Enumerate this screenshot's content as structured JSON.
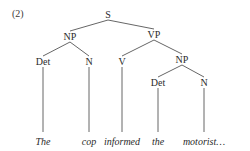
{
  "example_number": "(2)",
  "tree": {
    "nodes": [
      {
        "id": "S",
        "label": "S",
        "type": "phrase"
      },
      {
        "id": "NP1",
        "label": "NP",
        "type": "phrase"
      },
      {
        "id": "VP",
        "label": "VP",
        "type": "phrase"
      },
      {
        "id": "Det1",
        "label": "Det",
        "type": "category"
      },
      {
        "id": "N1",
        "label": "N",
        "type": "category"
      },
      {
        "id": "V",
        "label": "V",
        "type": "category"
      },
      {
        "id": "NP2",
        "label": "NP",
        "type": "phrase"
      },
      {
        "id": "Det2",
        "label": "Det",
        "type": "category"
      },
      {
        "id": "N2",
        "label": "N",
        "type": "category"
      },
      {
        "id": "w1",
        "label": "The",
        "type": "word"
      },
      {
        "id": "w2",
        "label": "cop",
        "type": "word"
      },
      {
        "id": "w3",
        "label": "informed",
        "type": "word"
      },
      {
        "id": "w4",
        "label": "the",
        "type": "word"
      },
      {
        "id": "w5",
        "label": "motorist…",
        "type": "word"
      }
    ],
    "edges": [
      [
        "S",
        "NP1"
      ],
      [
        "S",
        "VP"
      ],
      [
        "NP1",
        "Det1"
      ],
      [
        "NP1",
        "N1"
      ],
      [
        "VP",
        "V"
      ],
      [
        "VP",
        "NP2"
      ],
      [
        "NP2",
        "Det2"
      ],
      [
        "NP2",
        "N2"
      ],
      [
        "Det1",
        "w1"
      ],
      [
        "N1",
        "w2"
      ],
      [
        "V",
        "w3"
      ],
      [
        "Det2",
        "w4"
      ],
      [
        "N2",
        "w5"
      ]
    ]
  },
  "colors": {
    "text": "#2a2a2a",
    "edge": "#555555",
    "background": "#ffffff"
  }
}
